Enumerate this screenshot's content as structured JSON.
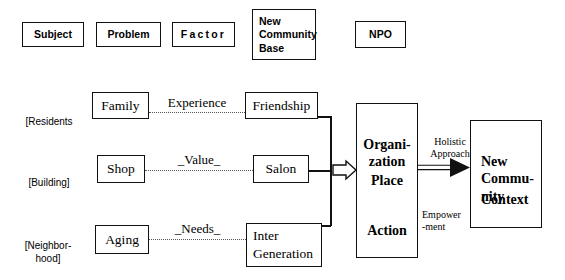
{
  "diagram": {
    "title_row": [
      {
        "label": "Subject"
      },
      {
        "label": "Problem"
      },
      {
        "label": "Factor"
      },
      {
        "label": "New\nCommunity\nBase"
      },
      {
        "label": "NPO"
      }
    ],
    "rows": [
      {
        "side_label": "[Residents",
        "subject": "Family",
        "relation": "Experience",
        "factor": "Friendship"
      },
      {
        "side_label": "[Building]",
        "subject": "Shop",
        "relation": "_Value_",
        "factor": "Salon"
      },
      {
        "side_label": "[Neighbor-\nhood]",
        "subject": "Aging",
        "relation": "_Needs_",
        "factor": "Inter\nGeneration"
      }
    ],
    "organization_box": {
      "items": [
        "Organi-\nzation",
        "Place",
        "Action"
      ]
    },
    "arrow_labels": {
      "top": "Holistic\nApproach",
      "bottom": "Empower\n-ment"
    },
    "result_box": {
      "lines": [
        "New\nCommu-\nnity",
        "Context"
      ]
    },
    "colors": {
      "stroke": "#111111",
      "background": "#ffffff",
      "dotted": "#555555"
    }
  }
}
